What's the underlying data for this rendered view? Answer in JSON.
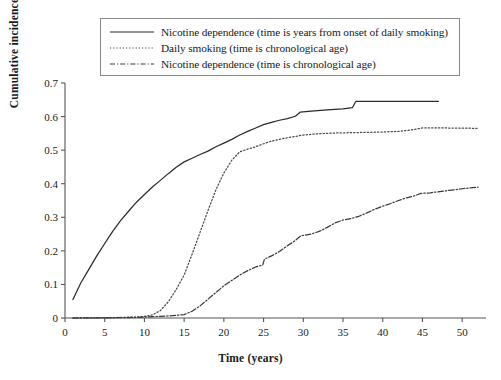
{
  "chart_data": {
    "type": "line",
    "title": "",
    "xlabel": "Time (years)",
    "ylabel": "Cumulative incidence",
    "xlim": [
      0,
      53
    ],
    "ylim": [
      0,
      0.7
    ],
    "xticks": [
      0,
      5,
      10,
      15,
      20,
      25,
      30,
      35,
      40,
      45,
      50
    ],
    "yticks": [
      "0",
      "0.1",
      "0.2",
      "0.3",
      "0.4",
      "0.5",
      "0.6",
      "0.7"
    ],
    "ytick_values": [
      0,
      0.1,
      0.2,
      0.3,
      0.4,
      0.5,
      0.6,
      0.7
    ],
    "grid": false,
    "legend_position": "top",
    "series": [
      {
        "name": "Nicotine dependence (time is years from onset of daily smoking)",
        "style": "solid",
        "color": "#2b2b2b",
        "points": [
          [
            1.0,
            0.055
          ],
          [
            2.0,
            0.105
          ],
          [
            3.0,
            0.145
          ],
          [
            4.0,
            0.185
          ],
          [
            5.0,
            0.222
          ],
          [
            6.0,
            0.258
          ],
          [
            7.0,
            0.29
          ],
          [
            8.0,
            0.318
          ],
          [
            9.0,
            0.345
          ],
          [
            10.0,
            0.368
          ],
          [
            11.0,
            0.39
          ],
          [
            12.0,
            0.41
          ],
          [
            13.0,
            0.43
          ],
          [
            14.0,
            0.449
          ],
          [
            15.0,
            0.465
          ],
          [
            16.0,
            0.476
          ],
          [
            17.0,
            0.487
          ],
          [
            18.0,
            0.497
          ],
          [
            19.0,
            0.51
          ],
          [
            20.0,
            0.521
          ],
          [
            21.0,
            0.532
          ],
          [
            22.0,
            0.545
          ],
          [
            23.0,
            0.556
          ],
          [
            24.0,
            0.566
          ],
          [
            25.0,
            0.576
          ],
          [
            26.0,
            0.583
          ],
          [
            27.0,
            0.589
          ],
          [
            28.0,
            0.594
          ],
          [
            29.0,
            0.601
          ],
          [
            29.6,
            0.613
          ],
          [
            31.0,
            0.616
          ],
          [
            33.0,
            0.62
          ],
          [
            35.0,
            0.623
          ],
          [
            36.2,
            0.627
          ],
          [
            36.6,
            0.645
          ],
          [
            40.0,
            0.645
          ],
          [
            44.0,
            0.645
          ],
          [
            47.0,
            0.645
          ]
        ]
      },
      {
        "name": "Daily smoking (time is chronological age)",
        "style": "dotted",
        "color": "#4a4a4a",
        "points": [
          [
            1.0,
            0.0
          ],
          [
            6.0,
            0.001
          ],
          [
            9.0,
            0.003
          ],
          [
            10.0,
            0.005
          ],
          [
            11.0,
            0.009
          ],
          [
            12.0,
            0.022
          ],
          [
            13.0,
            0.048
          ],
          [
            14.0,
            0.085
          ],
          [
            15.0,
            0.128
          ],
          [
            16.0,
            0.19
          ],
          [
            17.0,
            0.255
          ],
          [
            18.0,
            0.32
          ],
          [
            19.0,
            0.382
          ],
          [
            20.0,
            0.432
          ],
          [
            21.0,
            0.47
          ],
          [
            22.0,
            0.495
          ],
          [
            23.0,
            0.503
          ],
          [
            24.0,
            0.51
          ],
          [
            25.0,
            0.519
          ],
          [
            26.0,
            0.527
          ],
          [
            27.0,
            0.532
          ],
          [
            28.0,
            0.537
          ],
          [
            29.0,
            0.541
          ],
          [
            30.0,
            0.545
          ],
          [
            32.0,
            0.549
          ],
          [
            34.0,
            0.551
          ],
          [
            36.0,
            0.552
          ],
          [
            38.0,
            0.553
          ],
          [
            40.0,
            0.554
          ],
          [
            42.0,
            0.556
          ],
          [
            43.5,
            0.56
          ],
          [
            45.0,
            0.566
          ],
          [
            48.0,
            0.566
          ],
          [
            52.0,
            0.565
          ]
        ]
      },
      {
        "name": "Nicotine dependence (time is chronological age)",
        "style": "dashdot",
        "color": "#3a3a3a",
        "points": [
          [
            1.0,
            0.0
          ],
          [
            8.0,
            0.001
          ],
          [
            11.0,
            0.004
          ],
          [
            13.0,
            0.006
          ],
          [
            15.0,
            0.01
          ],
          [
            16.0,
            0.02
          ],
          [
            17.0,
            0.036
          ],
          [
            18.0,
            0.056
          ],
          [
            19.0,
            0.076
          ],
          [
            20.0,
            0.096
          ],
          [
            21.0,
            0.112
          ],
          [
            22.0,
            0.128
          ],
          [
            23.0,
            0.141
          ],
          [
            24.0,
            0.152
          ],
          [
            24.9,
            0.158
          ],
          [
            25.1,
            0.175
          ],
          [
            26.0,
            0.185
          ],
          [
            27.0,
            0.198
          ],
          [
            28.0,
            0.215
          ],
          [
            29.0,
            0.231
          ],
          [
            29.7,
            0.245
          ],
          [
            31.0,
            0.25
          ],
          [
            32.0,
            0.258
          ],
          [
            33.0,
            0.27
          ],
          [
            34.0,
            0.283
          ],
          [
            35.0,
            0.292
          ],
          [
            36.0,
            0.296
          ],
          [
            37.0,
            0.303
          ],
          [
            38.0,
            0.313
          ],
          [
            39.0,
            0.324
          ],
          [
            40.0,
            0.333
          ],
          [
            41.0,
            0.341
          ],
          [
            42.0,
            0.35
          ],
          [
            43.0,
            0.358
          ],
          [
            44.0,
            0.364
          ],
          [
            44.8,
            0.371
          ],
          [
            46.0,
            0.373
          ],
          [
            48.0,
            0.379
          ],
          [
            50.0,
            0.385
          ],
          [
            52.0,
            0.39
          ]
        ]
      }
    ]
  },
  "legend": {
    "entries": [
      {
        "label": "Nicotine dependence (time is years from onset of daily smoking)",
        "style": "solid"
      },
      {
        "label": "Daily smoking (time is chronological age)",
        "style": "dotted"
      },
      {
        "label": "Nicotine dependence (time is chronological age)",
        "style": "dashdot"
      }
    ]
  },
  "axes": {
    "x_title": "Time (years)",
    "y_title": "Cumulative incidence"
  }
}
